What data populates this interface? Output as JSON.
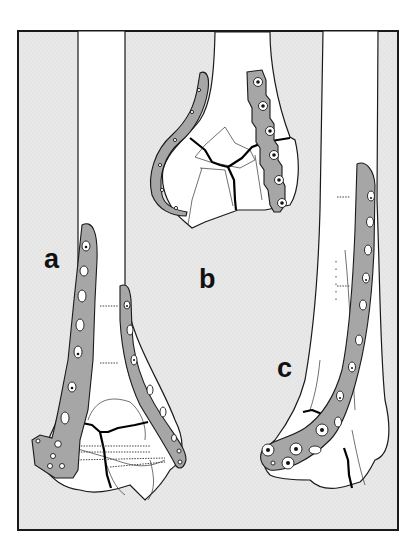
{
  "figure": {
    "type": "surgical-illustration",
    "colors": {
      "background": "#e9e9e9",
      "frame": "#1a1a1a",
      "bone": "#ffffff",
      "plate": "#a6a6a6",
      "fracture_line": "#000000"
    },
    "panels": [
      {
        "id": "a",
        "label": "a",
        "description": "Two plates (medial and lateral) on distal humerus with reconstructed condyles"
      },
      {
        "id": "b",
        "label": "b",
        "description": "Curved reconstruction plate and straight plate on distal humerus, lateral view"
      },
      {
        "id": "c",
        "label": "c",
        "description": "Single contoured plate wrapping around lateral condyle"
      }
    ]
  }
}
